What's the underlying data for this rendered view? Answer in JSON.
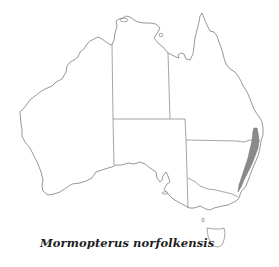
{
  "map": {
    "region": "Australia",
    "caption": "Mormopterus norfolkensis",
    "distribution_color": "#8a8a8a",
    "outline_color": "#6b6b6b",
    "background_color": "#ffffff"
  }
}
